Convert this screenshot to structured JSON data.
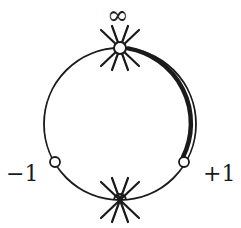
{
  "diagram": {
    "labels": {
      "top": "∞",
      "left": "−1",
      "right": "+1"
    },
    "circle": {
      "cx": 120,
      "cy": 124,
      "r": 76,
      "stroke": "#1a1a1a"
    },
    "points": [
      {
        "name": "infinity",
        "x": 120,
        "y": 48,
        "marker": "open-circle-with-cross"
      },
      {
        "name": "minus-one",
        "x": 55,
        "y": 162,
        "marker": "open-circle"
      },
      {
        "name": "plus-one",
        "x": 184,
        "y": 162,
        "marker": "open-circle"
      },
      {
        "name": "zero",
        "x": 120,
        "y": 200,
        "marker": "cross"
      }
    ],
    "highlighted_arc": {
      "from": "infinity",
      "to": "plus-one",
      "stroke_width": 4
    }
  }
}
